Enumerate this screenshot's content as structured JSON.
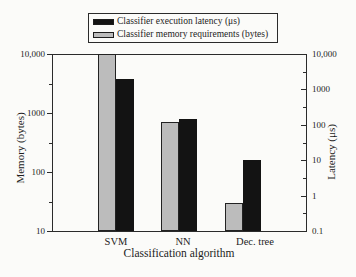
{
  "chart_data": {
    "type": "bar",
    "categories": [
      "SVM",
      "NN",
      "Dec. tree"
    ],
    "series": [
      {
        "name": "Classifier execution latency (μs)",
        "axis": "right",
        "color": "#131313",
        "values": [
          2000,
          150,
          10
        ]
      },
      {
        "name": "Classifier memory requirements (bytes)",
        "axis": "left",
        "color": "#bcbcbc",
        "values": [
          10000,
          700,
          30
        ]
      }
    ],
    "axes": {
      "left": {
        "label": "Memory (bytes)",
        "scale": "log",
        "range": [
          10,
          10000
        ],
        "tick_labels": [
          "10,000",
          "1000",
          "100",
          "10"
        ]
      },
      "right": {
        "label": "Latency (μs)",
        "scale": "log",
        "range": [
          0.1,
          10000
        ],
        "tick_labels": [
          "10,000",
          "1000",
          "100",
          "10",
          "1",
          "0.1"
        ]
      },
      "x": {
        "label": "Classification algorithm"
      }
    },
    "legend_position": "top",
    "grid": false
  }
}
